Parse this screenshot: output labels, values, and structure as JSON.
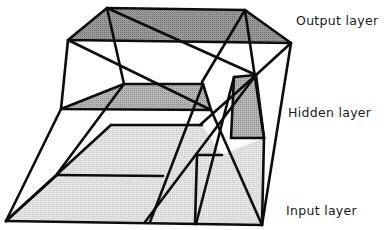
{
  "diagram": {
    "type": "neural-network-3d-layers",
    "labels": {
      "output": "Output layer",
      "hidden": "Hidden layer",
      "input": "Input layer"
    },
    "colors": {
      "output_fill": "#8c8c8c",
      "hidden_fill": "#a9a9a9",
      "input_fill": "#dcdcdc",
      "stroke": "#0d0d0d",
      "background": "#ffffff"
    }
  }
}
